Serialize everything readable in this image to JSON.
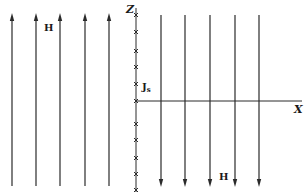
{
  "diagram": {
    "stroke_color": "#2a2a2a",
    "axes": {
      "z_label": "Z",
      "x_label": "X"
    },
    "labels": {
      "h_left": "H",
      "h_right": "H",
      "current_main": "J",
      "current_sub": "s"
    },
    "left_field": {
      "direction": "up",
      "count": 5,
      "x_positions": [
        12,
        36,
        60,
        85,
        109
      ]
    },
    "right_field": {
      "direction": "down",
      "count": 5,
      "x_positions": [
        161,
        185,
        210,
        235,
        259
      ]
    },
    "current_markers": {
      "symbol": "×",
      "meaning": "current into page",
      "y_positions": [
        15,
        32,
        51,
        67,
        84,
        101,
        124,
        140,
        158,
        174,
        190
      ]
    }
  }
}
